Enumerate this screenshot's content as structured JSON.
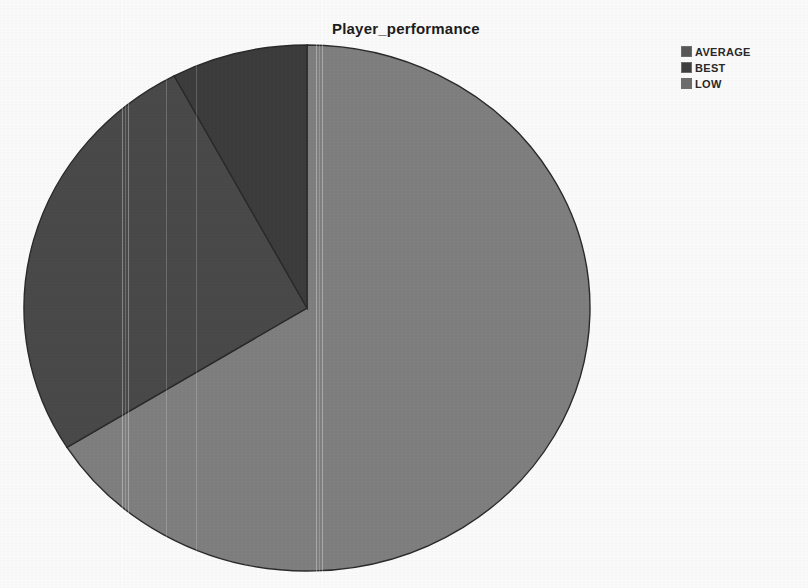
{
  "chart_data": {
    "type": "pie",
    "title": "Player_performance",
    "categories": [
      "AVERAGE",
      "BEST",
      "LOW"
    ],
    "values": [
      26,
      8,
      66
    ],
    "unit": "percent",
    "slices": [
      {
        "label": "LOW",
        "value": 66,
        "color": "#808080",
        "start_angle_deg": 0,
        "end_angle_deg": 238
      },
      {
        "label": "AVERAGE",
        "value": 26,
        "color": "#4a4a4a",
        "start_angle_deg": 238,
        "end_angle_deg": 332
      },
      {
        "label": "BEST",
        "value": 8,
        "color": "#3d3d3d",
        "start_angle_deg": 332,
        "end_angle_deg": 360
      }
    ],
    "legend": {
      "position": "right",
      "entries": [
        {
          "label": "AVERAGE",
          "color": "#585858"
        },
        {
          "label": "BEST",
          "color": "#3f3f3f"
        },
        {
          "label": "LOW",
          "color": "#6e6e6e"
        }
      ]
    },
    "xlabel": "",
    "ylabel": "",
    "grid": false,
    "labels_shown": false
  },
  "header": {
    "title": "Player_performance"
  },
  "legend": {
    "items": [
      {
        "label": "AVERAGE",
        "color": "#585858"
      },
      {
        "label": "BEST",
        "color": "#3f3f3f"
      },
      {
        "label": "LOW",
        "color": "#6e6e6e"
      }
    ]
  },
  "geometry": {
    "center_x": 307,
    "center_y": 308,
    "radius_x": 283,
    "radius_y": 263
  },
  "colors": {
    "background": "#fcfcfc",
    "title_text": "#1d1d1d",
    "slice_low": "#808080",
    "slice_average": "#4a4a4a",
    "slice_best": "#3d3d3d",
    "outline": "#2b2b2b"
  }
}
